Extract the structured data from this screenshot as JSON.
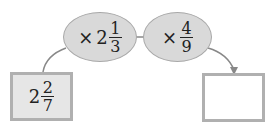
{
  "diagram": {
    "start_box": {
      "whole": "2",
      "numerator": "2",
      "denominator": "7"
    },
    "operations": [
      {
        "op": "×",
        "whole": "2",
        "numerator": "1",
        "denominator": "3"
      },
      {
        "op": "×",
        "whole": "",
        "numerator": "4",
        "denominator": "9"
      }
    ],
    "result_box": {
      "value": ""
    },
    "colors": {
      "fill": "#d9d9d9",
      "border": "#a8a8a8",
      "box_fill": "#e6e6e6"
    }
  }
}
